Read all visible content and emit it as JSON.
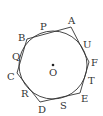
{
  "diagram": {
    "circle": {
      "label": "O",
      "cx": 53,
      "cy": 65,
      "r": 34
    },
    "vertices": [
      {
        "name": "A",
        "x": 71,
        "y": 27,
        "lx": 68,
        "ly": 24
      },
      {
        "name": "B",
        "x": 27,
        "y": 39,
        "lx": 18,
        "ly": 41
      },
      {
        "name": "C",
        "x": 17,
        "y": 73,
        "lx": 7,
        "ly": 80
      },
      {
        "name": "D",
        "x": 40,
        "y": 102,
        "lx": 38,
        "ly": 113
      },
      {
        "name": "E",
        "x": 80,
        "y": 93,
        "lx": 81,
        "ly": 102
      },
      {
        "name": "F",
        "x": 89,
        "y": 62,
        "lx": 91,
        "ly": 66
      }
    ],
    "tangent_points": [
      {
        "name": "P",
        "lx": 40,
        "ly": 30
      },
      {
        "name": "Q",
        "lx": 12,
        "ly": 60
      },
      {
        "name": "R",
        "lx": 21,
        "ly": 97
      },
      {
        "name": "S",
        "lx": 60,
        "ly": 109
      },
      {
        "name": "T",
        "lx": 88,
        "ly": 84
      },
      {
        "name": "U",
        "lx": 83,
        "ly": 48
      }
    ],
    "center_label": {
      "text": "O",
      "lx": 49,
      "ly": 76
    },
    "colors": {
      "stroke": "#333333",
      "background": "#ffffff"
    }
  }
}
